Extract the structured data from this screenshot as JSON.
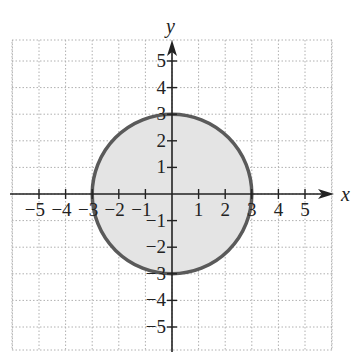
{
  "chart_data": {
    "type": "scatter",
    "subtype": "shaded-circle-region",
    "title": "",
    "xlabel": "x",
    "ylabel": "y",
    "xlim": [
      -6,
      6
    ],
    "ylim": [
      -6,
      6
    ],
    "grid": true,
    "grid_style": "dotted",
    "x_ticks": [
      -5,
      -4,
      -3,
      -2,
      -1,
      1,
      2,
      3,
      4,
      5
    ],
    "y_ticks": [
      -5,
      -4,
      -3,
      -2,
      -1,
      1,
      2,
      3,
      4,
      5
    ],
    "x_tick_labels": [
      "−5",
      "−4",
      "−3",
      "−2",
      "−1",
      "1",
      "2",
      "3",
      "4",
      "5"
    ],
    "y_tick_labels": [
      "−5",
      "−4",
      "−3",
      "−2",
      "−1",
      "1",
      "2",
      "3",
      "4",
      "5"
    ],
    "shapes": [
      {
        "kind": "circle",
        "center": [
          0,
          0
        ],
        "radius": 3,
        "equation": "x^2 + y^2 <= 9",
        "boundary": "solid",
        "filled": true,
        "fill_color": "#e4e4e4",
        "stroke_color": "#5a5a5a"
      }
    ]
  },
  "colors": {
    "axis": "#222222",
    "grid": "#b0b0b0",
    "fill": "#e4e4e4",
    "stroke": "#5a5a5a"
  }
}
